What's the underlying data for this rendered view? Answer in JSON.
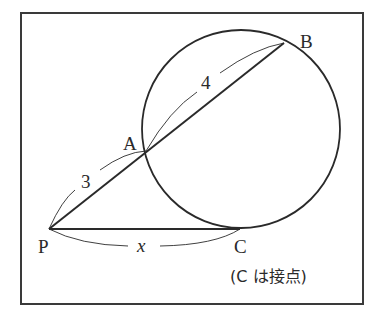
{
  "diagram": {
    "type": "geometry",
    "points": {
      "P": {
        "label": "P",
        "x": 49,
        "y": 229
      },
      "A": {
        "label": "A",
        "x": 146,
        "y": 151
      },
      "B": {
        "label": "B",
        "x": 284,
        "y": 43
      },
      "C": {
        "label": "C",
        "x": 240,
        "y": 229
      }
    },
    "circle": {
      "cx": 241,
      "cy": 129,
      "r": 99
    },
    "segments": [
      {
        "from": "P",
        "to": "B",
        "kind": "secant"
      },
      {
        "from": "P",
        "to": "C",
        "kind": "tangent"
      }
    ],
    "measures": {
      "PA": "3",
      "AB": "4",
      "PC": "x"
    },
    "note": "(C は接点)",
    "colors": {
      "stroke": "#2a2a2a",
      "frame": "#3a3a3a",
      "background": "#ffffff"
    }
  }
}
